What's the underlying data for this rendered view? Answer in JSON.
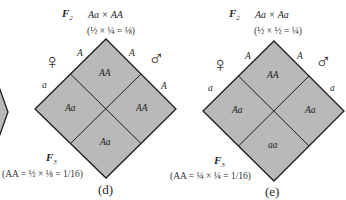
{
  "panels": [
    {
      "id": "d",
      "generation_top": "F",
      "generation_top_sub": "2",
      "cross": "Aa × AA",
      "probability_top": "(½ × ¼ = ⅛)",
      "female_symbol": "♀",
      "male_symbol": "♂",
      "female_alleles": [
        "A",
        "a"
      ],
      "male_alleles": [
        "A",
        "A"
      ],
      "cells": {
        "top": "AA",
        "left": "Aa",
        "right": "AA",
        "bottom": "Aa"
      },
      "generation_bottom": "F",
      "generation_bottom_sub": "3",
      "probability_bottom": "(AA = ½ × ⅛ = 1/16)",
      "caption": "(d)"
    },
    {
      "id": "e",
      "generation_top": "F",
      "generation_top_sub": "2",
      "cross": "Aa × Aa",
      "probability_top": "(½ × ½ = ¼)",
      "female_symbol": "♀",
      "male_symbol": "♂",
      "female_alleles": [
        "A",
        "a"
      ],
      "male_alleles": [
        "A",
        "a"
      ],
      "cells": {
        "top": "AA",
        "left": "Aa",
        "right": "Aa",
        "bottom": "aa"
      },
      "generation_bottom": "F",
      "generation_bottom_sub": "3",
      "probability_bottom": "(AA = ¼ × ¼ = 1/16)",
      "caption": "(e)"
    }
  ],
  "colors": {
    "cell_fill": "#b9b9b9",
    "outline": "#1e1e1e",
    "background": "#ffffff"
  }
}
